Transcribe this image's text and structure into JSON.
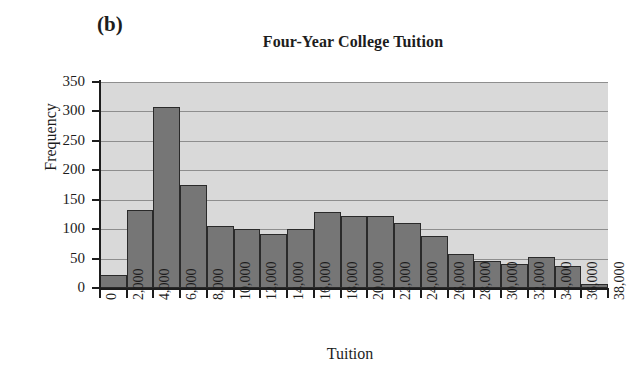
{
  "figure": {
    "panel_label": "(b)",
    "title": "Four-Year College Tuition",
    "x_axis_title": "Tuition",
    "y_axis_title": "Frequency"
  },
  "colors": {
    "bar_fill": "#767676",
    "bar_edge": "#2a2a2a",
    "plot_background": "#d9d9d9",
    "gridline": "#8e8e8e",
    "axis": "#1d1d1d",
    "page_background": "#ffffff"
  },
  "chart_data": {
    "type": "bar",
    "title": "Four-Year College Tuition",
    "subtitle": "(b)",
    "xlabel": "Tuition",
    "ylabel": "Frequency",
    "grid": true,
    "legend": "none",
    "xlim": [
      0,
      38000
    ],
    "ylim": [
      0,
      350
    ],
    "y_ticks": [
      0,
      50,
      100,
      150,
      200,
      250,
      300,
      350
    ],
    "y_tick_labels": [
      "0",
      "50",
      "100",
      "150",
      "200",
      "250",
      "300",
      "350"
    ],
    "x_ticks": [
      0,
      2000,
      4000,
      6000,
      8000,
      10000,
      12000,
      14000,
      16000,
      18000,
      20000,
      22000,
      24000,
      26000,
      28000,
      30000,
      32000,
      34000,
      36000,
      38000
    ],
    "x_tick_labels": [
      "0",
      "2,000",
      "4,000",
      "6,000",
      "8,000",
      "10,000",
      "12,000",
      "14,000",
      "16,000",
      "18,000",
      "20,000",
      "22,000",
      "24,000",
      "26,000",
      "28,000",
      "30,000",
      "32,000",
      "34,000",
      "36,000",
      "38,000"
    ],
    "bin_width": 2000,
    "bin_edges": [
      0,
      2000,
      4000,
      6000,
      8000,
      10000,
      12000,
      14000,
      16000,
      18000,
      20000,
      22000,
      24000,
      26000,
      28000,
      30000,
      32000,
      34000,
      36000,
      38000
    ],
    "categories": [
      "0-2,000",
      "2,000-4,000",
      "4,000-6,000",
      "6,000-8,000",
      "8,000-10,000",
      "10,000-12,000",
      "12,000-14,000",
      "14,000-16,000",
      "16,000-18,000",
      "18,000-20,000",
      "20,000-22,000",
      "22,000-24,000",
      "24,000-26,000",
      "26,000-28,000",
      "28,000-30,000",
      "30,000-32,000",
      "32,000-34,000",
      "34,000-36,000",
      "36,000-38,000"
    ],
    "values": [
      22,
      132,
      307,
      175,
      106,
      100,
      91,
      100,
      130,
      122,
      122,
      110,
      89,
      58,
      46,
      40,
      53,
      38,
      6
    ]
  }
}
